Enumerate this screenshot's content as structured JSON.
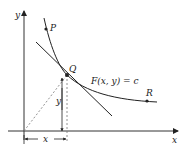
{
  "diagram": {
    "axes": {
      "x_label": "x",
      "y_label": "y"
    },
    "points": {
      "P": "P",
      "Q": "Q",
      "R": "R"
    },
    "curve_label": "F(x, y) = c",
    "dimension_labels": {
      "x": "x",
      "y": "y"
    },
    "colors": {
      "ink": "#222222",
      "dashed": "#777777",
      "axis": "#333333"
    }
  }
}
